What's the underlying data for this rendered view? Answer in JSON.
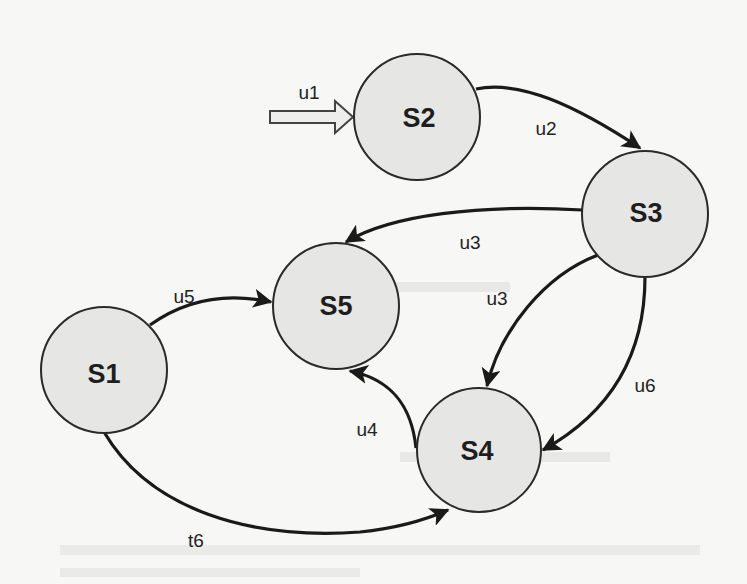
{
  "diagram": {
    "type": "state-transition",
    "initial": {
      "label": "u1",
      "target": "S2"
    },
    "nodes": [
      {
        "id": "S1",
        "label": "S1"
      },
      {
        "id": "S2",
        "label": "S2"
      },
      {
        "id": "S3",
        "label": "S3"
      },
      {
        "id": "S4",
        "label": "S4"
      },
      {
        "id": "S5",
        "label": "S5"
      }
    ],
    "edges": [
      {
        "from": "S2",
        "to": "S3",
        "label": "u2"
      },
      {
        "from": "S3",
        "to": "S5",
        "label": "u3"
      },
      {
        "from": "S3",
        "to": "S4",
        "label": "u3"
      },
      {
        "from": "S3",
        "to": "S4",
        "label": "u6"
      },
      {
        "from": "S1",
        "to": "S5",
        "label": "u5"
      },
      {
        "from": "S4",
        "to": "S5",
        "label": "u4"
      },
      {
        "from": "S1",
        "to": "S4",
        "label": "t6"
      }
    ]
  },
  "colors": {
    "node_fill": "#e6e6e4",
    "stroke": "#1a1a1a",
    "background": "#f7f7f5"
  }
}
